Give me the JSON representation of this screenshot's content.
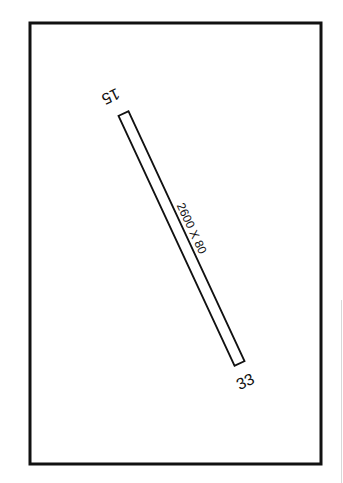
{
  "diagram": {
    "type": "airport-runway-diagram",
    "border": {
      "x": 30,
      "y": 23,
      "width": 291,
      "height": 441,
      "stroke": "#111111",
      "stroke_width": 3
    },
    "runway": {
      "label": "2600 X 80",
      "length_ft": 2600,
      "width_ft": 80,
      "end_a": {
        "designator": "15",
        "x": 123.5,
        "y": 113.5
      },
      "end_b": {
        "designator": "33",
        "x": 239.5,
        "y": 363.5
      },
      "stroke": "#111111"
    },
    "colors": {
      "background": "#ffffff",
      "ink": "#111111"
    }
  }
}
